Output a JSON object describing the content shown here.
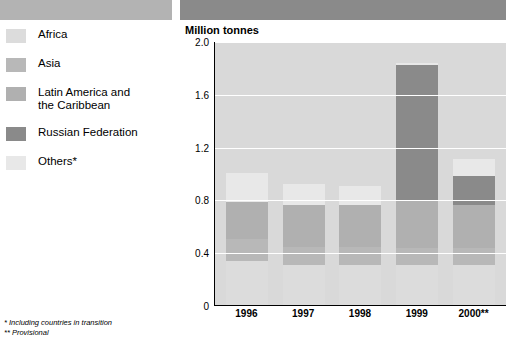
{
  "legend": {
    "items": [
      {
        "label": "Africa",
        "color": "#dcdcdc"
      },
      {
        "label": "Asia",
        "color": "#b8b8b8"
      },
      {
        "label": "Latin America and\nthe Caribbean",
        "color": "#b0b0b0"
      },
      {
        "label": "Russian Federation",
        "color": "#8a8a8a"
      },
      {
        "label": "Others*",
        "color": "#e8e8e8"
      }
    ]
  },
  "footnotes": {
    "line1": "* Including countries in transition",
    "line2": "** Provisional"
  },
  "chart_data": {
    "type": "bar",
    "stacked": true,
    "title": "Million tonnes",
    "xlabel": "",
    "ylabel": "Million tonnes",
    "categories": [
      "1996",
      "1997",
      "1998",
      "1999",
      "2000**"
    ],
    "ylim": [
      0,
      2.0
    ],
    "yticks": [
      "0",
      "0.4",
      "0.8",
      "1.2",
      "1.6",
      "2.0"
    ],
    "grid": true,
    "legend_position": "left",
    "series": [
      {
        "name": "Africa",
        "color": "#dcdcdc",
        "values": [
          0.33,
          0.3,
          0.3,
          0.3,
          0.3
        ]
      },
      {
        "name": "Asia",
        "color": "#b8b8b8",
        "values": [
          0.17,
          0.14,
          0.14,
          0.13,
          0.13
        ]
      },
      {
        "name": "Latin America and the Caribbean",
        "color": "#b0b0b0",
        "values": [
          0.28,
          0.32,
          0.32,
          0.36,
          0.33
        ]
      },
      {
        "name": "Russian Federation",
        "color": "#8a8a8a",
        "values": [
          0.0,
          0.0,
          0.0,
          1.03,
          0.22
        ]
      },
      {
        "name": "Others*",
        "color": "#e8e8e8",
        "values": [
          0.22,
          0.16,
          0.14,
          0.01,
          0.13
        ]
      }
    ],
    "totals": [
      1.0,
      0.92,
      0.9,
      1.83,
      1.11
    ]
  }
}
